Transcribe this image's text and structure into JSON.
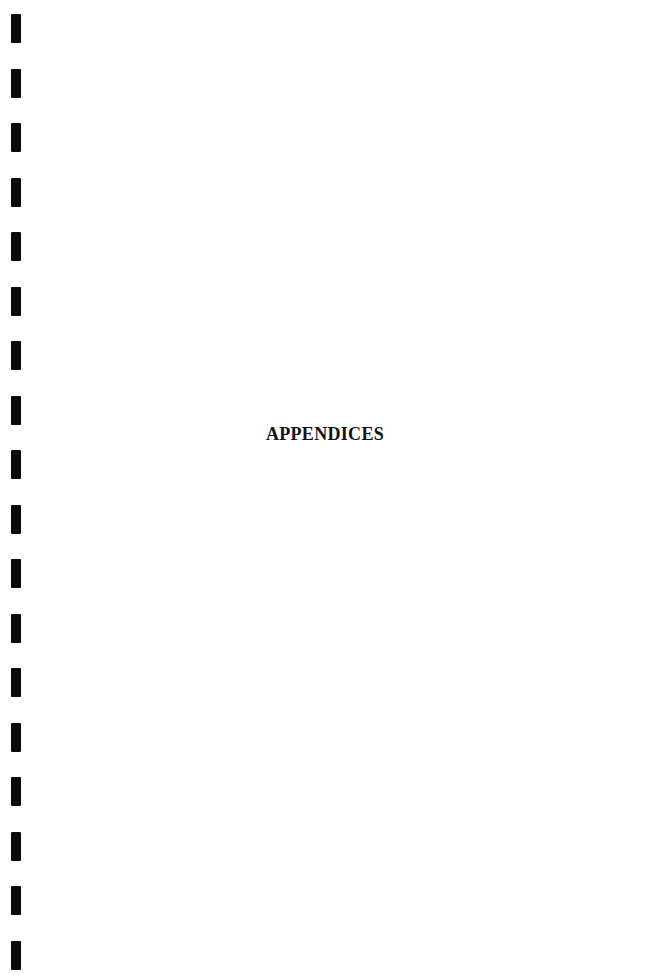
{
  "document": {
    "title": "APPENDICES"
  },
  "binding": {
    "hole_count": 18,
    "first_top": 14,
    "spacing": 54.5,
    "color": "#0a0a0a"
  }
}
